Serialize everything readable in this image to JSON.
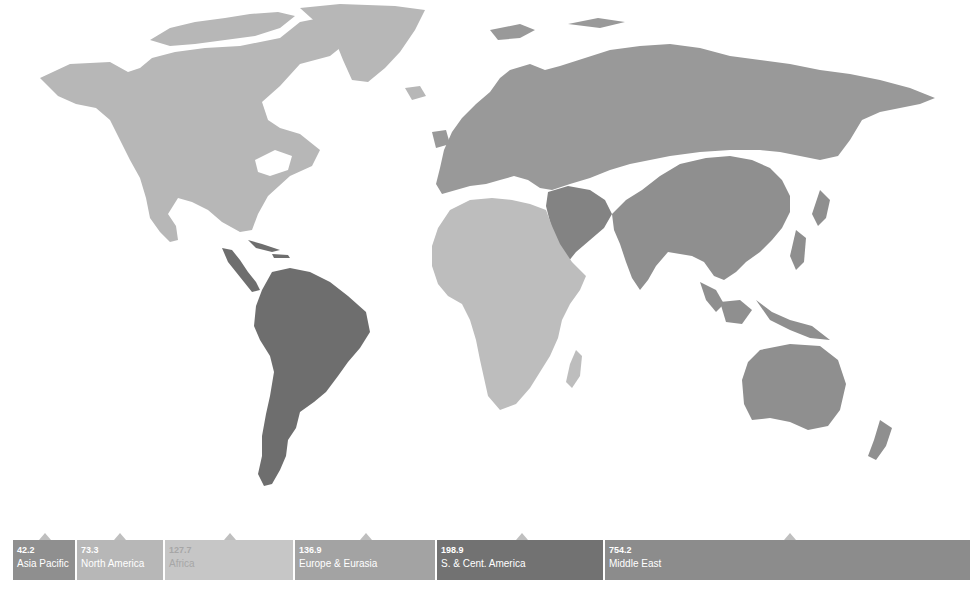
{
  "map": {
    "title": "World regions",
    "colors": {
      "north_america": "#b7b7b7",
      "s_cent_america": "#6e6e6e",
      "europe_eurasia": "#999999",
      "middle_east": "#838383",
      "africa": "#bdbdbd",
      "asia_pacific": "#8f8f8f"
    }
  },
  "legend": {
    "segments": [
      {
        "value": "42.2",
        "label": "Asia Pacific",
        "color": "#8f8f8f",
        "text_color": "#ffffff"
      },
      {
        "value": "73.3",
        "label": "North America",
        "color": "#b7b7b7",
        "text_color": "#ffffff"
      },
      {
        "value": "127.7",
        "label": "Africa",
        "color": "#c6c6c6",
        "text_color": "#a6a6a6"
      },
      {
        "value": "136.9",
        "label": "Europe & Eurasia",
        "color": "#a3a3a3",
        "text_color": "#ffffff"
      },
      {
        "value": "198.9",
        "label": "S. & Cent. America",
        "color": "#727272",
        "text_color": "#ffffff"
      },
      {
        "value": "754.2",
        "label": "Middle East",
        "color": "#8c8c8c",
        "text_color": "#ffffff"
      }
    ]
  }
}
